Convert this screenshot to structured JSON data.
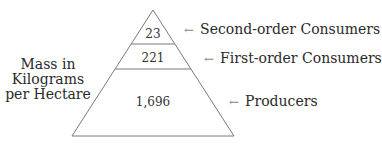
{
  "diagram": {
    "axis_label_lines": [
      "Mass in",
      "Kilograms",
      "per Hectare"
    ],
    "arrow_glyph": "←",
    "levels": [
      {
        "name": "Second-order Consumers",
        "value": "23"
      },
      {
        "name": "First-order Consumers",
        "value": "221"
      },
      {
        "name": "Producers",
        "value": "1,696"
      }
    ],
    "line_color": "#7a7a7a"
  }
}
